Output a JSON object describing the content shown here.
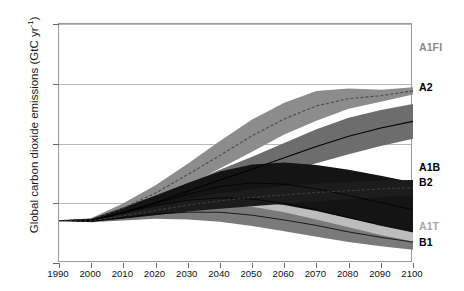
{
  "chart_data": {
    "type": "area",
    "title": "",
    "xlabel": "",
    "ylabel": "Global carbon dioxide emissions (GtC yr",
    "ylabel_exponent": "-1",
    "ylabel_suffix": ")",
    "xlim": [
      1990,
      2100
    ],
    "ylim": [
      0,
      40
    ],
    "yticks": [
      0,
      10,
      20,
      30,
      40
    ],
    "xticks": [
      1990,
      2000,
      2010,
      2020,
      2030,
      2040,
      2050,
      2060,
      2070,
      2080,
      2090,
      2100
    ],
    "grid": "horizontal",
    "legend_position": "right-outside",
    "x": [
      1990,
      2000,
      2010,
      2020,
      2030,
      2040,
      2050,
      2060,
      2070,
      2080,
      2090,
      2100
    ],
    "series": [
      {
        "name": "A1FI",
        "label": "A1FI",
        "color": "#8c8c8c",
        "label_color": "#8c8c8c",
        "kind": "range-band",
        "upper": [
          7.1,
          7.5,
          10.0,
          13.0,
          16.6,
          20.4,
          24.0,
          26.8,
          28.8,
          29.2,
          29.0,
          29.4
        ],
        "lower": [
          7.1,
          7.0,
          8.3,
          10.3,
          13.0,
          15.8,
          18.6,
          21.5,
          23.8,
          25.8,
          27.0,
          28.2
        ],
        "marker_line": [
          7.1,
          7.3,
          9.2,
          11.7,
          14.8,
          18.0,
          21.3,
          24.1,
          26.3,
          27.5,
          28.0,
          28.8
        ],
        "marker_style": "dashed"
      },
      {
        "name": "A2",
        "label": "A2",
        "color": "#6d6d6d",
        "label_color": "#000000",
        "kind": "range-band",
        "upper": [
          7.1,
          7.3,
          9.0,
          11.0,
          13.3,
          15.6,
          17.8,
          20.1,
          22.4,
          24.3,
          25.6,
          26.6
        ],
        "lower": [
          7.1,
          6.9,
          7.8,
          9.2,
          10.8,
          12.3,
          13.7,
          15.1,
          16.7,
          18.2,
          19.6,
          20.8
        ],
        "marker_line": [
          7.1,
          7.1,
          8.4,
          10.1,
          12.0,
          13.9,
          15.7,
          17.6,
          19.5,
          21.2,
          22.6,
          23.7
        ],
        "marker_style": "solid"
      },
      {
        "name": "A1B",
        "label": "A1B",
        "color": "#141414",
        "label_color": "#000000",
        "kind": "range-band",
        "upper": [
          7.1,
          7.4,
          9.3,
          11.3,
          13.4,
          15.3,
          16.5,
          16.8,
          16.4,
          15.6,
          14.6,
          13.5
        ],
        "lower": [
          7.1,
          6.9,
          7.6,
          8.6,
          9.5,
          10.2,
          10.3,
          9.7,
          8.7,
          7.5,
          6.3,
          5.2
        ],
        "marker_line": [
          7.1,
          7.2,
          8.5,
          10.0,
          11.5,
          12.8,
          13.4,
          13.2,
          12.4,
          11.3,
          10.1,
          8.9
        ],
        "marker_style": "solid-thin"
      },
      {
        "name": "B2",
        "label": "B2",
        "color": "#1c1c1c",
        "label_color": "#000000",
        "kind": "range-band",
        "upper": [
          7.1,
          7.2,
          8.4,
          9.6,
          10.7,
          11.7,
          12.4,
          12.9,
          13.3,
          13.6,
          13.8,
          13.9
        ],
        "lower": [
          7.1,
          6.9,
          7.4,
          8.0,
          8.6,
          9.1,
          9.5,
          9.9,
          10.3,
          10.7,
          11.0,
          11.3
        ],
        "marker_line": [
          7.1,
          7.05,
          7.9,
          8.8,
          9.7,
          10.4,
          11.0,
          11.4,
          11.8,
          12.1,
          12.4,
          12.6
        ],
        "marker_style": "dashed-thin"
      },
      {
        "name": "A1T",
        "label": "A1T",
        "color": "#bdbdbd",
        "label_color": "#a8a8a8",
        "kind": "range-band",
        "upper": [
          7.1,
          7.4,
          9.0,
          10.5,
          11.6,
          12.2,
          12.2,
          11.6,
          10.6,
          9.4,
          8.1,
          7.0
        ],
        "lower": [
          7.1,
          7.0,
          7.9,
          8.9,
          9.5,
          9.7,
          9.4,
          8.5,
          7.3,
          6.0,
          4.7,
          3.6
        ],
        "marker_line": [
          7.1,
          7.2,
          8.4,
          9.6,
          10.5,
          10.9,
          10.7,
          10.0,
          8.9,
          7.6,
          6.3,
          5.2
        ],
        "marker_style": "solid-thin"
      },
      {
        "name": "B1",
        "label": "B1",
        "color": "#7a7a7a",
        "label_color": "#000000",
        "kind": "range-band",
        "upper": [
          7.1,
          7.1,
          8.1,
          9.1,
          9.8,
          10.1,
          9.9,
          9.2,
          8.2,
          7.0,
          5.8,
          4.8
        ],
        "lower": [
          7.1,
          6.8,
          7.1,
          7.4,
          7.3,
          6.9,
          6.2,
          5.3,
          4.4,
          3.5,
          2.8,
          2.2
        ],
        "marker_line": [
          7.1,
          6.95,
          7.6,
          8.2,
          8.5,
          8.5,
          8.0,
          7.2,
          6.3,
          5.2,
          4.3,
          3.5
        ],
        "marker_style": "solid-thin"
      }
    ],
    "legend": [
      {
        "label": "A1FI",
        "y_px": 48,
        "color": "#8c8c8c"
      },
      {
        "label": "A2",
        "y_px": 88,
        "color": "#000000"
      },
      {
        "label": "A1B",
        "y_px": 168,
        "color": "#000000"
      },
      {
        "label": "B2",
        "y_px": 183,
        "color": "#000000"
      },
      {
        "label": "A1T",
        "y_px": 227,
        "color": "#a8a8a8"
      },
      {
        "label": "B1",
        "y_px": 243,
        "color": "#000000"
      }
    ]
  }
}
